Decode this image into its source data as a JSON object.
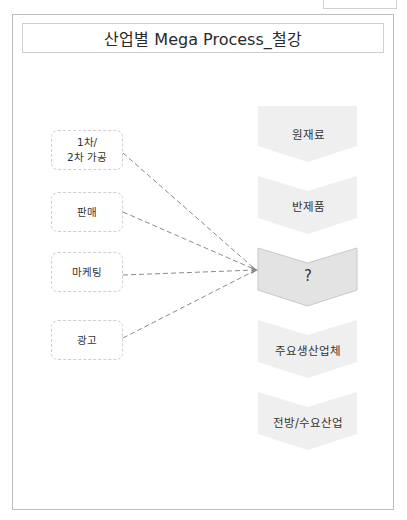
{
  "title": "산업별 Mega Process_철강",
  "left_items": [
    {
      "label": "1차/\n2차 가공"
    },
    {
      "label": "판매"
    },
    {
      "label": "마케팅"
    },
    {
      "label": "광고"
    }
  ],
  "process_steps": [
    {
      "label": "원재료",
      "highlighted": false
    },
    {
      "label": "반제품",
      "highlighted": false
    },
    {
      "label": "?",
      "highlighted": true
    },
    {
      "label": "주요생산업체",
      "highlighted": false
    },
    {
      "label": "전방/수요산업",
      "highlighted": false
    }
  ],
  "colors": {
    "step_fill": "#efefef",
    "highlight_fill": "#e3e3e3",
    "highlight_stroke": "#c8c8c8",
    "dashed_line": "#8a8a8a",
    "box_border": "#cfcfcf"
  }
}
